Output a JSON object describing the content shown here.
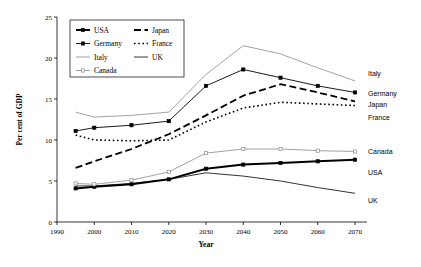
{
  "chart_data": {
    "type": "line",
    "title": "",
    "xlabel": "Year",
    "ylabel": "Per cent of GDP",
    "xlim": [
      1990,
      2070
    ],
    "ylim": [
      0,
      25
    ],
    "xticks": [
      1990,
      2000,
      2010,
      2020,
      2030,
      2040,
      2050,
      2060,
      2070
    ],
    "yticks": [
      0,
      5,
      10,
      15,
      20,
      25
    ],
    "xticklabels": [
      "1990",
      "2000",
      "2010",
      "2020",
      "2030",
      "2040",
      "2050",
      "2060",
      "2070"
    ],
    "yticklabels": [
      "0",
      "5",
      "10",
      "15",
      "20",
      "25"
    ],
    "grid": false,
    "legend_position": "upper-left-inside",
    "x": [
      1995,
      2000,
      2010,
      2020,
      2030,
      2040,
      2050,
      2060,
      2070
    ],
    "series": [
      {
        "name": "USA",
        "values": [
          4.1,
          4.3,
          4.6,
          5.2,
          6.5,
          7.0,
          7.2,
          7.4,
          7.6
        ],
        "style": "thick-solid-marker",
        "color": "#000000",
        "end_label": "USA"
      },
      {
        "name": "Japan",
        "values": [
          6.6,
          7.4,
          8.9,
          10.7,
          13.0,
          15.4,
          16.8,
          15.8,
          14.7
        ],
        "style": "thick-dashed",
        "color": "#000000",
        "end_label": "Japan"
      },
      {
        "name": "Germany",
        "values": [
          11.1,
          11.5,
          11.8,
          12.3,
          16.6,
          18.6,
          17.6,
          16.6,
          15.8
        ],
        "style": "thin-solid-marker",
        "color": "#000000",
        "end_label": "Germany"
      },
      {
        "name": "France",
        "values": [
          10.6,
          10.0,
          9.9,
          10.0,
          12.2,
          13.9,
          14.6,
          14.4,
          14.2
        ],
        "style": "dotted",
        "color": "#000000",
        "end_label": "France"
      },
      {
        "name": "Italy",
        "values": [
          13.4,
          12.8,
          13.0,
          13.4,
          18.0,
          21.5,
          20.5,
          18.8,
          17.2
        ],
        "style": "thin-solid-gray",
        "color": "#8a8a8a",
        "end_label": "Italy"
      },
      {
        "name": "UK",
        "values": [
          4.4,
          4.4,
          4.7,
          5.2,
          6.0,
          5.6,
          5.0,
          4.2,
          3.5
        ],
        "style": "thin-solid-black",
        "color": "#000000",
        "end_label": "UK"
      },
      {
        "name": "Canada",
        "values": [
          4.7,
          4.6,
          5.1,
          6.1,
          8.4,
          8.9,
          8.9,
          8.7,
          8.6
        ],
        "style": "gray-open-marker",
        "color": "#8a8a8a",
        "end_label": "Canada"
      }
    ],
    "legend_entries": [
      "USA",
      "Japan",
      "Germany",
      "France",
      "Italy",
      "UK",
      "Canada"
    ]
  }
}
